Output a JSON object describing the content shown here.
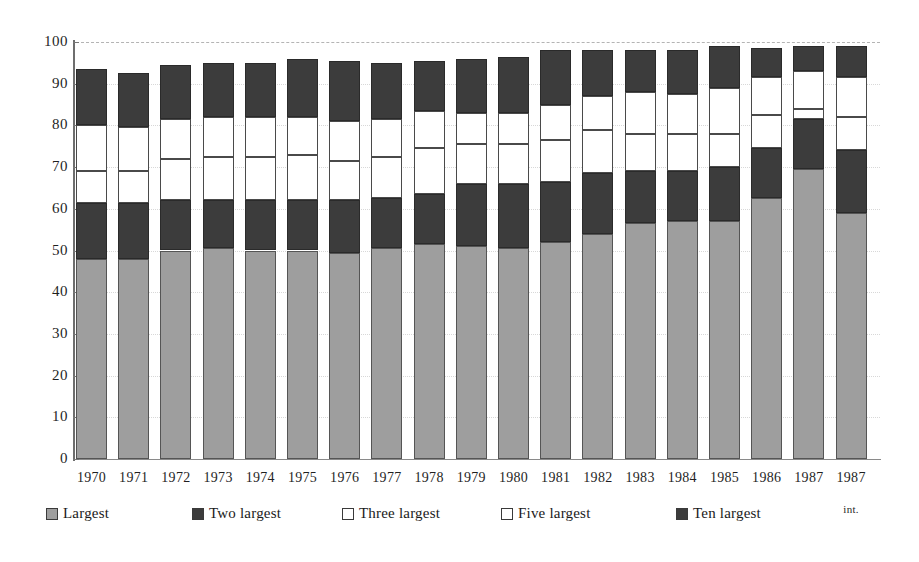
{
  "chart_data": {
    "type": "bar",
    "subtype": "stacked-bar",
    "title": "",
    "subtitle": "",
    "xlabel": "",
    "ylabel": "",
    "ylim": [
      0,
      100
    ],
    "yticks": [
      0,
      10,
      20,
      30,
      40,
      50,
      60,
      70,
      80,
      90,
      100
    ],
    "grid": "top-dashed-only",
    "legend_position": "bottom",
    "categories": [
      "1970",
      "1971",
      "1972",
      "1973",
      "1974",
      "1975",
      "1976",
      "1977",
      "1978",
      "1979",
      "1980",
      "1981",
      "1982",
      "1983",
      "1984",
      "1985",
      "1986",
      "1987",
      "1987 int."
    ],
    "category_sublabels": [
      "",
      "",
      "",
      "",
      "",
      "",
      "",
      "",
      "",
      "",
      "",
      "",
      "",
      "",
      "",
      "",
      "",
      "",
      "int."
    ],
    "series": [
      {
        "name": "Largest",
        "color": "#9e9e9e",
        "values": [
          48.0,
          48.0,
          50.0,
          50.5,
          50.0,
          50.0,
          49.5,
          50.5,
          51.5,
          51.0,
          50.5,
          52.0,
          54.0,
          56.5,
          57.0,
          57.0,
          62.5,
          69.5,
          59.0
        ]
      },
      {
        "name": "Two largest",
        "color": "#3c3c3c",
        "values": [
          13.5,
          13.5,
          12.0,
          11.5,
          12.0,
          12.0,
          12.5,
          12.0,
          12.0,
          15.0,
          15.5,
          14.5,
          14.5,
          12.5,
          12.0,
          13.0,
          12.0,
          12.0,
          15.0
        ]
      },
      {
        "name": "Three largest",
        "color": "#ffffff",
        "values": [
          7.5,
          7.5,
          10.0,
          10.5,
          10.5,
          11.0,
          9.5,
          10.0,
          11.0,
          9.5,
          9.5,
          10.0,
          10.5,
          9.0,
          9.0,
          8.0,
          8.0,
          2.5,
          8.0
        ]
      },
      {
        "name": "Five largest",
        "color": "#ffffff",
        "values": [
          11.0,
          10.5,
          9.5,
          9.5,
          9.5,
          9.0,
          9.5,
          9.0,
          9.0,
          7.5,
          7.5,
          8.5,
          8.0,
          10.0,
          9.5,
          11.0,
          9.0,
          9.0,
          9.5
        ]
      },
      {
        "name": "Ten largest",
        "color": "#3c3c3c",
        "values": [
          13.5,
          13.0,
          13.0,
          13.0,
          13.0,
          14.0,
          14.5,
          13.5,
          12.0,
          13.0,
          13.5,
          13.0,
          11.0,
          10.0,
          10.5,
          10.0,
          7.0,
          6.0,
          7.5
        ]
      }
    ],
    "totals": [
      93.5,
      92.5,
      94.5,
      95.0,
      95.0,
      96.0,
      95.5,
      95.0,
      95.5,
      96.0,
      96.5,
      98.0,
      98.0,
      98.0,
      98.0,
      99.0,
      98.5,
      99.0,
      99.0
    ]
  },
  "axis": {
    "y_tick_labels": [
      "100",
      "90",
      "80",
      "70",
      "60",
      "50",
      "40",
      "30",
      "20",
      "10",
      "0"
    ],
    "x_tick_labels": [
      {
        "main": "1970",
        "sub": ""
      },
      {
        "main": "1971",
        "sub": ""
      },
      {
        "main": "1972",
        "sub": ""
      },
      {
        "main": "1973",
        "sub": ""
      },
      {
        "main": "1974",
        "sub": ""
      },
      {
        "main": "1975",
        "sub": ""
      },
      {
        "main": "1976",
        "sub": ""
      },
      {
        "main": "1977",
        "sub": ""
      },
      {
        "main": "1978",
        "sub": ""
      },
      {
        "main": "1979",
        "sub": ""
      },
      {
        "main": "1980",
        "sub": ""
      },
      {
        "main": "1981",
        "sub": ""
      },
      {
        "main": "1982",
        "sub": ""
      },
      {
        "main": "1983",
        "sub": ""
      },
      {
        "main": "1984",
        "sub": ""
      },
      {
        "main": "1985",
        "sub": ""
      },
      {
        "main": "1986",
        "sub": ""
      },
      {
        "main": "1987",
        "sub": ""
      },
      {
        "main": "1987",
        "sub": "int."
      }
    ]
  },
  "legend": {
    "items": [
      {
        "label": "Largest",
        "swatch": "largest",
        "color": "#9e9e9e"
      },
      {
        "label": "Two largest",
        "swatch": "two",
        "color": "#3c3c3c"
      },
      {
        "label": "Three largest",
        "swatch": "three",
        "color": "#ffffff"
      },
      {
        "label": "Five largest",
        "swatch": "five",
        "color": "#ffffff"
      },
      {
        "label": "Ten largest",
        "swatch": "ten",
        "color": "#3c3c3c"
      }
    ]
  },
  "colors": {
    "largest": "#9e9e9e",
    "two_largest": "#3c3c3c",
    "three_largest": "#ffffff",
    "five_largest": "#ffffff",
    "ten_largest": "#3c3c3c",
    "axis": "#6e6e6e",
    "text": "#1a1a1a",
    "background": "#ffffff"
  }
}
